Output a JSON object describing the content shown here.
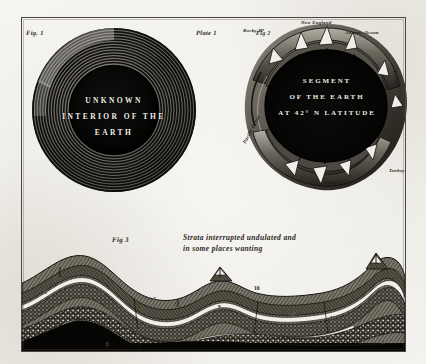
{
  "plate": {
    "title": "Plate 1",
    "fig1_label": "Fig. 1",
    "fig2_label": "Fig 2",
    "fig3_label": "Fig 3",
    "paper_color": "#f2f1ee",
    "ink_color": "#1e1c18",
    "border_color": "#4a4740"
  },
  "fig1": {
    "caption_line1": "UNKNOWN",
    "caption_line2": "INTERIOR OF THE",
    "caption_line3": "EARTH",
    "ring_count": 14,
    "core_color": "#060606"
  },
  "fig2": {
    "caption_line1": "SEGMENT",
    "caption_line2": "OF THE EARTH",
    "caption_line3": "AT 42° N LATITUDE",
    "core_color": "#070707",
    "labels": [
      {
        "text": "Rocky Mᵗ",
        "x": 6,
        "y": 14
      },
      {
        "text": "New England",
        "x": 64,
        "y": 6
      },
      {
        "text": "Atlantic Ocean",
        "x": 108,
        "y": 16
      },
      {
        "text": "Europe",
        "x": 160,
        "y": 56
      },
      {
        "text": "Turkey",
        "x": 152,
        "y": 154
      },
      {
        "text": "China",
        "x": 88,
        "y": 166
      },
      {
        "text": "Pacific Ocean",
        "x": 5,
        "y": 128
      }
    ]
  },
  "fig3": {
    "caption_line1": "Strata interrupted undulated and",
    "caption_line2": "in some places wanting",
    "stratum_numbers": [
      {
        "n": "7",
        "x": 78,
        "y": 18
      },
      {
        "n": "6",
        "x": 33,
        "y": 27
      },
      {
        "n": "5",
        "x": 22,
        "y": 40
      },
      {
        "n": "4",
        "x": 120,
        "y": 58
      },
      {
        "n": "3",
        "x": 131,
        "y": 47
      },
      {
        "n": "2",
        "x": 83,
        "y": 74
      },
      {
        "n": "1",
        "x": 84,
        "y": 92
      },
      {
        "n": "8",
        "x": 152,
        "y": 52
      },
      {
        "n": "9",
        "x": 196,
        "y": 55
      },
      {
        "n": "10",
        "x": 232,
        "y": 36
      },
      {
        "n": "11",
        "x": 268,
        "y": 62
      },
      {
        "n": "12",
        "x": 308,
        "y": 66
      },
      {
        "n": "1",
        "x": 360,
        "y": 90
      }
    ]
  }
}
